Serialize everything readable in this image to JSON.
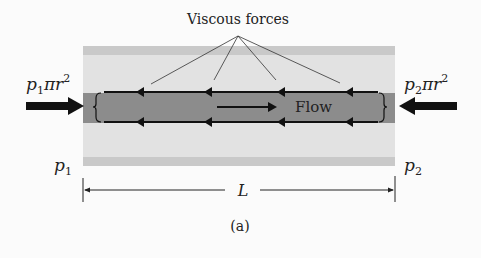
{
  "figure": {
    "caption": "(a)",
    "title_label": "Viscous forces",
    "flow_label": "Flow",
    "left_force": {
      "p": "p",
      "sub": "1",
      "rest": "πr",
      "sup": "2"
    },
    "right_force": {
      "p": "p",
      "sub": "2",
      "rest": "πr",
      "sup": "2"
    },
    "left_pressure": {
      "p": "p",
      "sub": "1"
    },
    "right_pressure": {
      "p": "p",
      "sub": "2"
    },
    "length_label": "L"
  },
  "colors": {
    "background": "#fbfbfb",
    "tube_band": "#c9c9c9",
    "tube_light": "#e2e2e2",
    "core": "#8c8c8c",
    "ink": "#111111"
  }
}
